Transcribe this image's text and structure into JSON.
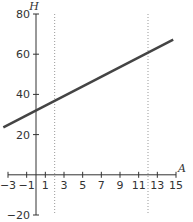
{
  "chart_data": {
    "type": "line",
    "title": "",
    "xlabel": "A",
    "ylabel": "H",
    "xlim": [
      -3,
      15
    ],
    "ylim": [
      -20,
      80
    ],
    "x_ticks": [
      -3,
      -1,
      1,
      3,
      5,
      7,
      9,
      11,
      13,
      15
    ],
    "y_ticks": [
      -20,
      20,
      40,
      60,
      80
    ],
    "grid": false,
    "series": [
      {
        "name": "H",
        "x": [
          -3.5,
          14.7
        ],
        "values": [
          23.6,
          67.3
        ],
        "color": "#444444"
      }
    ],
    "reference_lines": [
      {
        "orientation": "vertical",
        "x": 2,
        "style": "dotted"
      },
      {
        "orientation": "vertical",
        "x": 12,
        "style": "dotted"
      }
    ]
  }
}
